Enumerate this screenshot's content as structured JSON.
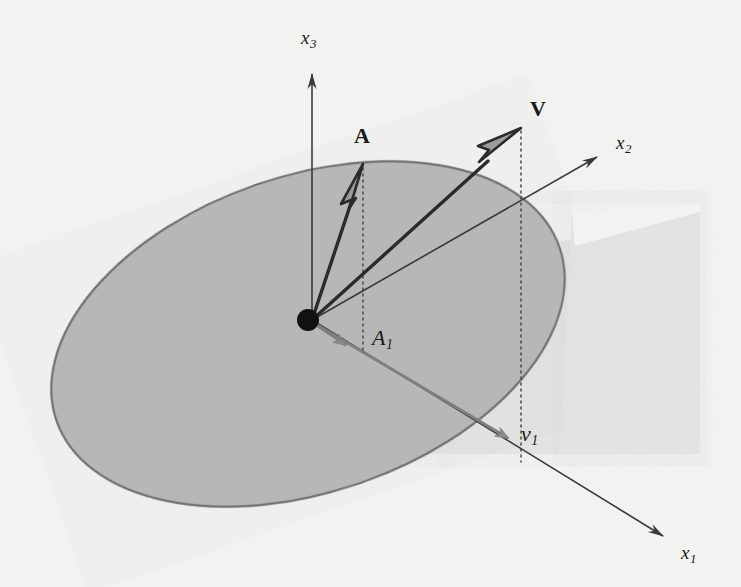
{
  "figure": {
    "background_color": "#f2f2f0",
    "ink_color": "#333333",
    "plane_fill_color": "#b5b5b5",
    "plane_stroke_color": "#6e6e6e",
    "vertical_plane_fill_color": "#e0e0e0",
    "arrow_fill_color": "#8c8c8c",
    "origin_color": "#111111"
  },
  "axes": [
    {
      "id": "x3",
      "label": "x",
      "subscript": "3",
      "direction": "up",
      "from": [
        312,
        320
      ],
      "to": [
        312,
        66
      ],
      "label_pos": [
        301,
        28
      ]
    },
    {
      "id": "x2",
      "label": "x",
      "subscript": "2",
      "direction": "upper-right",
      "from": [
        312,
        320
      ],
      "to": [
        606,
        152
      ],
      "label_pos": [
        616,
        133
      ]
    },
    {
      "id": "x1",
      "label": "x",
      "subscript": "1",
      "direction": "lower-right",
      "from": [
        312,
        320
      ],
      "to": [
        672,
        541
      ],
      "label_pos": [
        681,
        543
      ]
    }
  ],
  "vectors": [
    {
      "id": "A",
      "label": "A",
      "style": "bold-upright",
      "kind": "outlined-arrow",
      "from": [
        312,
        320
      ],
      "to": [
        363,
        166
      ],
      "label_pos": [
        354,
        125
      ]
    },
    {
      "id": "V",
      "label": "V",
      "style": "bold-upright",
      "kind": "outlined-arrow",
      "from": [
        312,
        320
      ],
      "to": [
        521,
        129
      ],
      "label_pos": [
        530,
        98
      ]
    }
  ],
  "projections": [
    {
      "id": "A1",
      "label": "A",
      "subscript": "1",
      "style": "italic",
      "kind": "filled-gray-arrow",
      "from": [
        312,
        320
      ],
      "to": [
        352,
        348
      ],
      "label_pos": [
        372,
        327
      ],
      "dotted_from": [
        363,
        166
      ],
      "dotted_to": [
        363,
        352
      ]
    },
    {
      "id": "v1",
      "label": "v",
      "subscript": "1",
      "style": "italic",
      "kind": "filled-gray-arrow",
      "from": [
        312,
        320
      ],
      "to": [
        517,
        443
      ],
      "label_pos": [
        521,
        423
      ],
      "dotted_from": [
        521,
        129
      ],
      "dotted_to": [
        521,
        462
      ]
    }
  ],
  "shapes": [
    {
      "id": "horizontal-plane",
      "type": "ellipse",
      "center": [
        308,
        334
      ],
      "rx": 266,
      "ry": 158,
      "rotation_deg": -19,
      "fill": "#b5b5b5",
      "stroke": "#6e6e6e"
    },
    {
      "id": "vertical-plane",
      "type": "parallelogram",
      "points": [
        [
          451,
          205
        ],
        [
          700,
          205
        ],
        [
          700,
          455
        ],
        [
          451,
          455
        ]
      ],
      "fill": "#e0e0e0"
    },
    {
      "id": "origin-dot",
      "type": "circle",
      "center": [
        308,
        320
      ],
      "r": 10,
      "fill": "#111111"
    }
  ],
  "labels": {
    "x3": "x",
    "x3_sub": "3",
    "x2": "x",
    "x2_sub": "2",
    "x1": "x",
    "x1_sub": "1",
    "A": "A",
    "V": "V",
    "A1": "A",
    "A1_sub": "1",
    "v1": "v",
    "v1_sub": "1"
  }
}
